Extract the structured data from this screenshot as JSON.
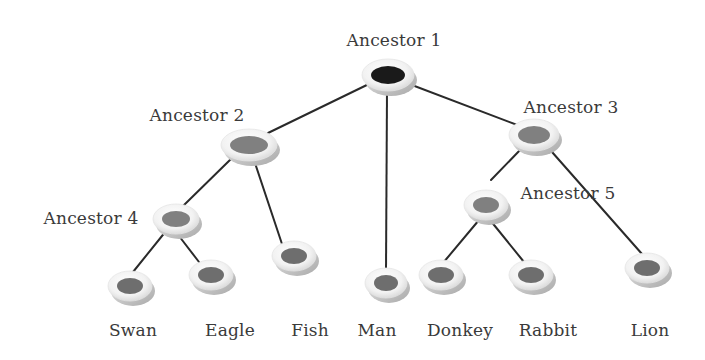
{
  "diagram": {
    "type": "phylogenetic-tree",
    "colors": {
      "edge": "#2a2a2a",
      "ring": "#f4f4f4",
      "ring_shadow": "#bdbdbd",
      "root_core": "#1a1a1a",
      "internal_core": "#808080",
      "leaf_core": "#6e6e6e",
      "text": "#3a3a3a"
    },
    "nodes": [
      {
        "id": "a1",
        "label": "Ancestor 1",
        "kind": "root",
        "x": 388,
        "y": 75,
        "rx": 17,
        "ry": 9,
        "label_x": 394,
        "label_y": 40
      },
      {
        "id": "a2",
        "label": "Ancestor 2",
        "kind": "internal",
        "x": 249,
        "y": 145,
        "rx": 19,
        "ry": 9,
        "label_x": 197,
        "label_y": 115
      },
      {
        "id": "a3",
        "label": "Ancestor 3",
        "kind": "internal",
        "x": 534,
        "y": 135,
        "rx": 16,
        "ry": 9,
        "label_x": 571,
        "label_y": 107
      },
      {
        "id": "a4",
        "label": "Ancestor 4",
        "kind": "internal",
        "x": 176,
        "y": 219,
        "rx": 14,
        "ry": 8,
        "label_x": 91,
        "label_y": 218
      },
      {
        "id": "a5",
        "label": "Ancestor 5",
        "kind": "internal",
        "x": 486,
        "y": 205,
        "rx": 13,
        "ry": 8,
        "label_x": 568,
        "label_y": 193
      },
      {
        "id": "swan",
        "label": "Swan",
        "kind": "leaf",
        "x": 130,
        "y": 286,
        "rx": 13,
        "ry": 8,
        "label_x": 133,
        "label_y": 330
      },
      {
        "id": "eagle",
        "label": "Eagle",
        "kind": "leaf",
        "x": 211,
        "y": 275,
        "rx": 13,
        "ry": 8,
        "label_x": 230,
        "label_y": 330
      },
      {
        "id": "fish",
        "label": "Fish",
        "kind": "leaf",
        "x": 294,
        "y": 256,
        "rx": 13,
        "ry": 8,
        "label_x": 310,
        "label_y": 330
      },
      {
        "id": "man",
        "label": "Man",
        "kind": "leaf",
        "x": 386,
        "y": 283,
        "rx": 12,
        "ry": 8,
        "label_x": 377,
        "label_y": 330
      },
      {
        "id": "donkey",
        "label": "Donkey",
        "kind": "leaf",
        "x": 441,
        "y": 275,
        "rx": 13,
        "ry": 8,
        "label_x": 460,
        "label_y": 330
      },
      {
        "id": "rabbit",
        "label": "Rabbit",
        "kind": "leaf",
        "x": 531,
        "y": 275,
        "rx": 13,
        "ry": 8,
        "label_x": 548,
        "label_y": 330
      },
      {
        "id": "lion",
        "label": "Lion",
        "kind": "leaf",
        "x": 647,
        "y": 268,
        "rx": 13,
        "ry": 8,
        "label_x": 650,
        "label_y": 330
      }
    ],
    "edges": [
      {
        "from": "a1",
        "to": "a2",
        "x1": 373,
        "y1": 82,
        "x2": 268,
        "y2": 133
      },
      {
        "from": "a1",
        "to": "a3",
        "x1": 404,
        "y1": 82,
        "x2": 520,
        "y2": 126
      },
      {
        "from": "a1",
        "to": "man",
        "x1": 387,
        "y1": 91,
        "x2": 386,
        "y2": 272
      },
      {
        "from": "a2",
        "to": "a4",
        "x1": 233,
        "y1": 157,
        "x2": 182,
        "y2": 207
      },
      {
        "from": "a2",
        "to": "fish",
        "x1": 254,
        "y1": 160,
        "x2": 282,
        "y2": 244
      },
      {
        "from": "a4",
        "to": "swan",
        "x1": 166,
        "y1": 231,
        "x2": 133,
        "y2": 272
      },
      {
        "from": "a4",
        "to": "eagle",
        "x1": 179,
        "y1": 236,
        "x2": 199,
        "y2": 262
      },
      {
        "from": "a3",
        "to": "a5",
        "x1": 522,
        "y1": 148,
        "x2": 491,
        "y2": 180
      },
      {
        "from": "a3",
        "to": "lion",
        "x1": 552,
        "y1": 152,
        "x2": 642,
        "y2": 254
      },
      {
        "from": "a5",
        "to": "donkey",
        "x1": 479,
        "y1": 220,
        "x2": 443,
        "y2": 263
      },
      {
        "from": "a5",
        "to": "rabbit",
        "x1": 490,
        "y1": 220,
        "x2": 524,
        "y2": 262
      }
    ]
  }
}
